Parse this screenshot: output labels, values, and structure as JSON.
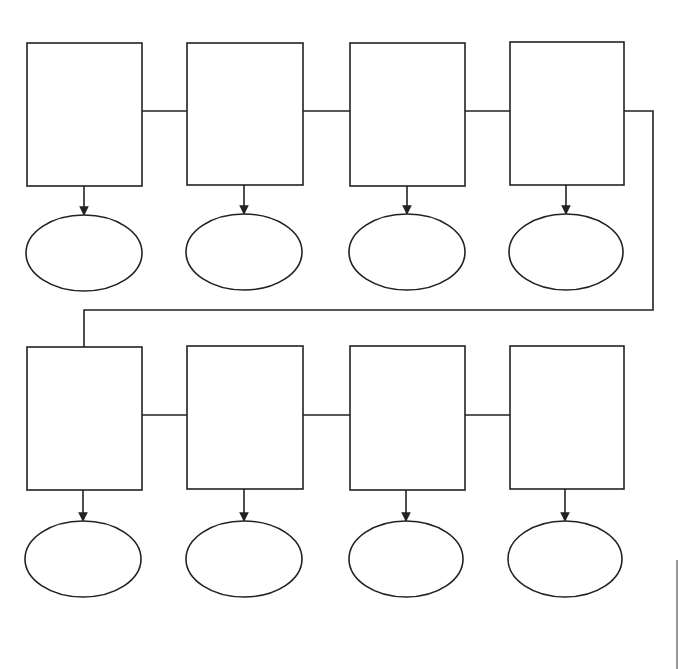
{
  "diagram": {
    "type": "flowchart-graphic-organizer",
    "background": "#ffffff",
    "stroke_color": "#222222",
    "rows": [
      {
        "id": "row-1",
        "boxes": [
          {
            "id": "box-1",
            "x": 27,
            "y": 43,
            "w": 115,
            "h": 143,
            "label": ""
          },
          {
            "id": "box-2",
            "x": 187,
            "y": 43,
            "w": 116,
            "h": 142,
            "label": ""
          },
          {
            "id": "box-3",
            "x": 350,
            "y": 43,
            "w": 115,
            "h": 143,
            "label": ""
          },
          {
            "id": "box-4",
            "x": 510,
            "y": 42,
            "w": 114,
            "h": 143,
            "label": ""
          }
        ],
        "ovals": [
          {
            "id": "oval-1",
            "cx": 84,
            "cy": 253,
            "rx": 58,
            "ry": 38,
            "label": ""
          },
          {
            "id": "oval-2",
            "cx": 244,
            "cy": 252,
            "rx": 58,
            "ry": 38,
            "label": ""
          },
          {
            "id": "oval-3",
            "cx": 407,
            "cy": 252,
            "rx": 58,
            "ry": 38,
            "label": ""
          },
          {
            "id": "oval-4",
            "cx": 566,
            "cy": 252,
            "rx": 57,
            "ry": 38,
            "label": ""
          }
        ],
        "connector_y": 111
      },
      {
        "id": "row-2",
        "boxes": [
          {
            "id": "box-5",
            "x": 27,
            "y": 347,
            "w": 115,
            "h": 143,
            "label": ""
          },
          {
            "id": "box-6",
            "x": 187,
            "y": 346,
            "w": 116,
            "h": 143,
            "label": ""
          },
          {
            "id": "box-7",
            "x": 350,
            "y": 346,
            "w": 115,
            "h": 144,
            "label": ""
          },
          {
            "id": "box-8",
            "x": 510,
            "y": 346,
            "w": 114,
            "h": 143,
            "label": ""
          }
        ],
        "ovals": [
          {
            "id": "oval-5",
            "cx": 83,
            "cy": 559,
            "rx": 58,
            "ry": 38,
            "label": ""
          },
          {
            "id": "oval-6",
            "cx": 244,
            "cy": 559,
            "rx": 58,
            "ry": 38,
            "label": ""
          },
          {
            "id": "oval-7",
            "cx": 406,
            "cy": 559,
            "rx": 57,
            "ry": 38,
            "label": ""
          },
          {
            "id": "oval-8",
            "cx": 565,
            "cy": 559,
            "rx": 57,
            "ry": 38,
            "label": ""
          }
        ],
        "connector_y": 415
      }
    ],
    "wrap_connector": {
      "from": "box-4",
      "to": "box-5",
      "points": [
        [
          624,
          111
        ],
        [
          653,
          111
        ],
        [
          653,
          310
        ],
        [
          84,
          310
        ],
        [
          84,
          347
        ]
      ]
    },
    "edge_artifact_line": {
      "x": 677,
      "y1": 560,
      "y2": 669
    }
  }
}
